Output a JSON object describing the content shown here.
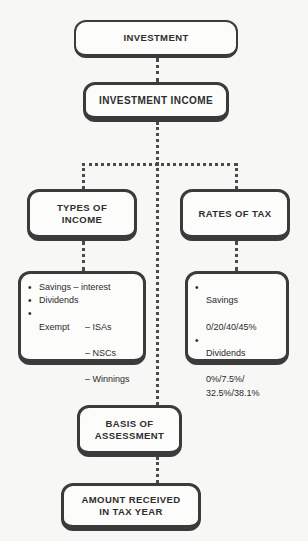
{
  "diagram": {
    "colors": {
      "background": "#f7f7f6",
      "node_fill": "#fcfcfb",
      "border": "#3b3b3b",
      "connector": "#4a4a4a",
      "text": "#2e2e2e"
    },
    "nodes": {
      "investment": "INVESTMENT",
      "investment_income": "INVESTMENT INCOME",
      "types_of_income": "TYPES OF\nINCOME",
      "rates_of_tax": "RATES OF TAX",
      "basis_of_assessment": "BASIS OF\nASSESSMENT",
      "amount_received": "AMOUNT RECEIVED\nIN TAX YEAR"
    },
    "types_list": {
      "items": [
        {
          "label": "Savings – interest",
          "subs": []
        },
        {
          "label": "Dividends",
          "subs": []
        },
        {
          "label": "Exempt",
          "subs": [
            "– ISAs",
            "– NSCs",
            "– Winnings"
          ]
        }
      ]
    },
    "rates_list": {
      "items": [
        {
          "label": "Savings",
          "value": "0/20/40/45%"
        },
        {
          "label": "Dividends",
          "value": "0%/7.5%/\n32.5%/38.1%"
        }
      ]
    },
    "bullet_glyph": "•"
  }
}
